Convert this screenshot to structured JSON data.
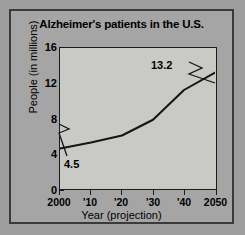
{
  "chart_data": {
    "type": "line",
    "title": "Alzheimer's patients in the U.S.",
    "xlabel": "Year (projection)",
    "ylabel": "People (in millions)",
    "x": [
      2000,
      2010,
      2020,
      2030,
      2040,
      2050
    ],
    "values": [
      4.5,
      5.2,
      6.0,
      7.8,
      11.2,
      13.2
    ],
    "xtick_labels": [
      "2000",
      "'10",
      "'20",
      "'30",
      "'40",
      "2050"
    ],
    "ytick_labels": [
      "0",
      "4",
      "8",
      "12",
      "16"
    ],
    "ytick_values": [
      0,
      4,
      8,
      12,
      16
    ],
    "xlim": [
      2000,
      2050
    ],
    "ylim": [
      0,
      16
    ],
    "grid": false,
    "legend": false,
    "annotations": [
      {
        "label": "4.5",
        "x": 2000,
        "y": 4.5
      },
      {
        "label": "13.2",
        "x": 2050,
        "y": 13.2
      }
    ],
    "line_color": "#141414",
    "plot_background": "#c9c9c6",
    "figure_background": "#a5a5a5"
  }
}
